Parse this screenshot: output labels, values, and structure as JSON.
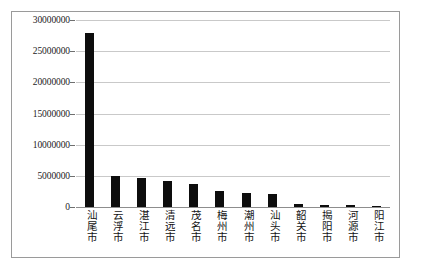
{
  "chart_data": {
    "type": "bar",
    "title": "",
    "subtitle": "",
    "xlabel": "",
    "ylabel": "",
    "ylim": [
      0,
      30000000
    ],
    "grid": true,
    "legend": false,
    "legend_position": "none",
    "bar_color": "#0d0d0d",
    "gridline_color": "#c9c9c9",
    "axis_color": "#8d8d8d",
    "categories": [
      "汕尾市",
      "云浮市",
      "湛江市",
      "清远市",
      "茂名市",
      "梅州市",
      "潮州市",
      "汕头市",
      "韶关市",
      "揭阳市",
      "河源市",
      "阳江市"
    ],
    "values": [
      27900000,
      4900000,
      4600000,
      4200000,
      3700000,
      2600000,
      2250000,
      2150000,
      450000,
      400000,
      250000,
      50000
    ],
    "ytick_values": [
      0,
      5000000,
      10000000,
      15000000,
      20000000,
      25000000,
      30000000
    ],
    "ytick_labels": [
      "0",
      "5000000",
      "10000000",
      "15000000",
      "20000000",
      "25000000",
      "30000000"
    ]
  }
}
